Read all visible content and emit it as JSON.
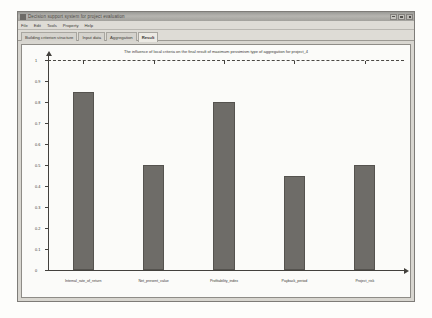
{
  "window": {
    "title": "Decision support system for project evaluation",
    "controls": {
      "minimize": "_",
      "maximize": "□",
      "close": "×"
    }
  },
  "menu": {
    "items": [
      {
        "label": "File"
      },
      {
        "label": "Edit"
      },
      {
        "label": "Tools"
      },
      {
        "label": "Property"
      },
      {
        "label": "Help"
      }
    ]
  },
  "tabs": [
    {
      "label": "Building criterion structure",
      "active": false
    },
    {
      "label": "Input data",
      "active": false
    },
    {
      "label": "Aggregation",
      "active": false
    },
    {
      "label": "Result",
      "active": true
    }
  ],
  "chart_data": {
    "type": "bar",
    "title": "The influence of local criteria on the final result of maximum pessimism type of aggregation for project_4",
    "xlabel": "",
    "ylabel": "",
    "categories": [
      "Internal_rate_of_return",
      "Net_present_value",
      "Profitability_index",
      "Payback_period",
      "Project_risk"
    ],
    "values": [
      0.85,
      0.5,
      0.8,
      0.45,
      0.5
    ],
    "ylim": [
      0,
      1
    ],
    "yticks": [
      0,
      0.1,
      0.2,
      0.3,
      0.4,
      0.5,
      0.6,
      0.7,
      0.8,
      0.9,
      1
    ],
    "ytick_labels": [
      "0",
      "0.1",
      "0.2",
      "0.3",
      "0.4",
      "0.5",
      "0.6",
      "0.7",
      "0.8",
      "0.9",
      "1"
    ],
    "grid": false,
    "legend": null,
    "annotations": [
      {
        "type": "threshold-line",
        "value": 1,
        "style": "dashed"
      }
    ],
    "colors": {
      "bar_fill": "#6e6c68",
      "bar_border": "#55534f",
      "axis": "#43413d",
      "plot_background": "#fbfbf9"
    }
  }
}
